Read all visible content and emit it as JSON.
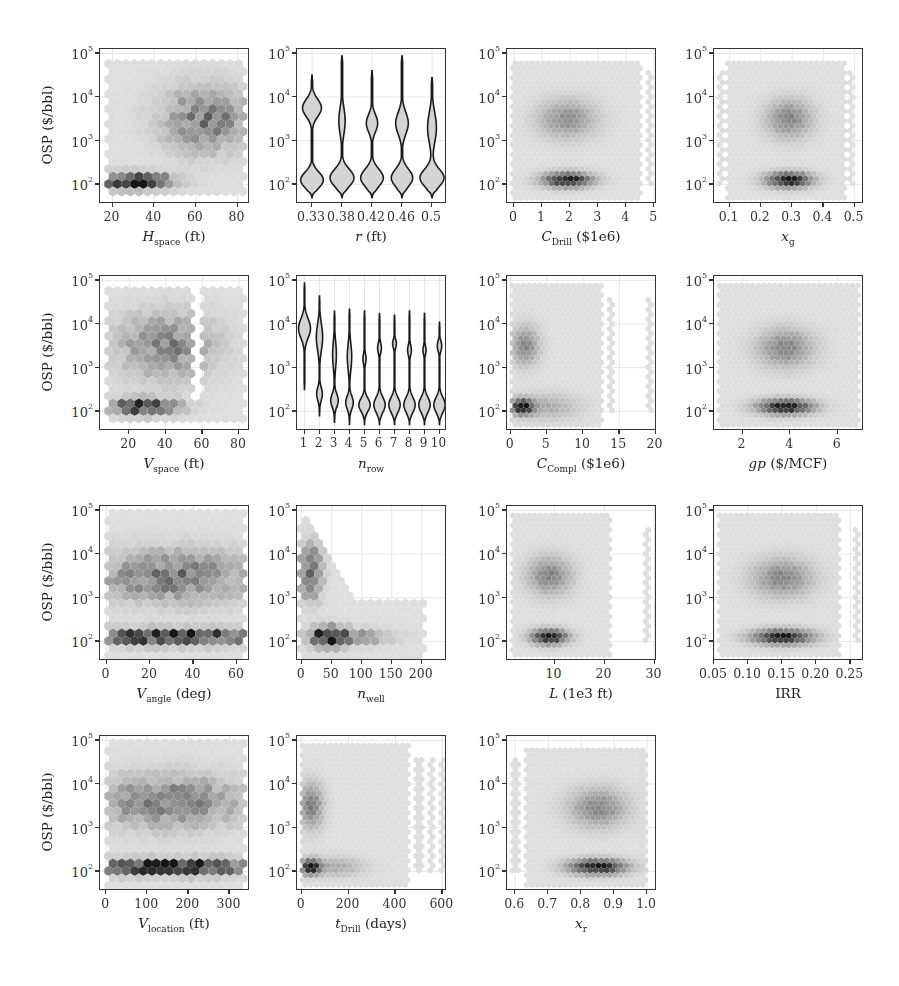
{
  "figure": {
    "ylabel": "OSP ($/bbl)",
    "yticks": [
      {
        "base": "10",
        "exp": "2",
        "value": 100
      },
      {
        "base": "10",
        "exp": "3",
        "value": 1000
      },
      {
        "base": "10",
        "exp": "4",
        "value": 10000
      },
      {
        "base": "10",
        "exp": "5",
        "value": 100000
      }
    ],
    "ylim_log10": [
      1.55,
      5.1
    ]
  },
  "chart_data": [
    {
      "type": "heatmap",
      "style": "hexbin",
      "xlabel_main": "H",
      "xlabel_sub": "space",
      "xlabel_unit": " (ft)",
      "italic": true,
      "xlim": [
        14,
        86
      ],
      "xticks": [
        20,
        40,
        60,
        80
      ],
      "ylabel": "OSP ($/bbl)",
      "yscale": "log",
      "clusters": [
        {
          "x": 30,
          "y": 2.08,
          "sx": 12,
          "sy": 0.12,
          "w": 1.0
        },
        {
          "x": 65,
          "y": 3.5,
          "sx": 14,
          "sy": 0.5,
          "w": 0.5
        }
      ],
      "span": {
        "xmin": 17,
        "xmax": 84,
        "ymin": 1.7,
        "ymax": 4.9
      },
      "coarse": true
    },
    {
      "type": "violin",
      "xlabel_main": "r",
      "xlabel_sub": "",
      "xlabel_unit": " (ft)",
      "italic": true,
      "categories": [
        "0.33",
        "0.38",
        "0.42",
        "0.46",
        "0.5"
      ],
      "yscale": "log",
      "violins": [
        {
          "lo": 1.7,
          "hi": 4.5,
          "modes": [
            {
              "y": 2.1,
              "w": 0.9,
              "s": 0.18
            },
            {
              "y": 3.75,
              "w": 0.75,
              "s": 0.2
            }
          ]
        },
        {
          "lo": 1.7,
          "hi": 4.95,
          "modes": [
            {
              "y": 2.15,
              "w": 0.95,
              "s": 0.2
            },
            {
              "y": 3.45,
              "w": 0.25,
              "s": 0.3
            }
          ]
        },
        {
          "lo": 1.7,
          "hi": 4.6,
          "modes": [
            {
              "y": 2.15,
              "w": 0.9,
              "s": 0.2
            },
            {
              "y": 3.4,
              "w": 0.45,
              "s": 0.2
            }
          ]
        },
        {
          "lo": 1.7,
          "hi": 4.95,
          "modes": [
            {
              "y": 2.15,
              "w": 0.85,
              "s": 0.2
            },
            {
              "y": 3.4,
              "w": 0.5,
              "s": 0.25
            }
          ]
        },
        {
          "lo": 1.7,
          "hi": 4.45,
          "modes": [
            {
              "y": 2.15,
              "w": 0.95,
              "s": 0.2
            },
            {
              "y": 3.3,
              "w": 0.35,
              "s": 0.35
            }
          ]
        }
      ]
    },
    {
      "type": "heatmap",
      "style": "hexbin",
      "xlabel_main": "C",
      "xlabel_sub": "Drill",
      "xlabel_unit": " ($1e6)",
      "italic": true,
      "xlim": [
        -0.25,
        5.1
      ],
      "xticks": [
        0,
        1,
        2,
        3,
        4,
        5
      ],
      "yscale": "log",
      "clusters": [
        {
          "x": 1.9,
          "y": 2.1,
          "sx": 0.6,
          "sy": 0.12,
          "w": 1.0
        },
        {
          "x": 1.9,
          "y": 3.5,
          "sx": 0.7,
          "sy": 0.3,
          "w": 0.4
        }
      ],
      "span": {
        "xmin": -0.1,
        "xmax": 4.5,
        "ymin": 1.65,
        "ymax": 4.85
      },
      "stripes": [
        4.85
      ]
    },
    {
      "type": "heatmap",
      "style": "hexbin",
      "xlabel_main": "x",
      "xlabel_sub": "g",
      "xlabel_unit": "",
      "italic": true,
      "xlim": [
        0.05,
        0.53
      ],
      "xticks": [
        "0.1",
        "0.2",
        "0.3",
        "0.4",
        "0.5"
      ],
      "xtickvals": [
        0.1,
        0.2,
        0.3,
        0.4,
        0.5
      ],
      "yscale": "log",
      "clusters": [
        {
          "x": 0.29,
          "y": 2.1,
          "sx": 0.05,
          "sy": 0.12,
          "w": 1.0
        },
        {
          "x": 0.29,
          "y": 3.5,
          "sx": 0.05,
          "sy": 0.3,
          "w": 0.45
        }
      ],
      "span": {
        "xmin": 0.09,
        "xmax": 0.47,
        "ymin": 1.65,
        "ymax": 4.85
      },
      "stripes": [
        0.075,
        0.49
      ]
    },
    {
      "type": "heatmap",
      "style": "hexbin",
      "xlabel_main": "V",
      "xlabel_sub": "space",
      "xlabel_unit": " (ft)",
      "italic": true,
      "xlim": [
        4,
        86
      ],
      "xticks": [
        20,
        40,
        60,
        80
      ],
      "yscale": "log",
      "clusters": [
        {
          "x": 28,
          "y": 2.1,
          "sx": 12,
          "sy": 0.12,
          "w": 1.0
        },
        {
          "x": 40,
          "y": 3.5,
          "sx": 18,
          "sy": 0.5,
          "w": 0.45
        }
      ],
      "span": {
        "xmin": 8,
        "xmax": 84,
        "ymin": 1.7,
        "ymax": 4.9
      },
      "coarse": true,
      "gap": [
        54,
        60
      ]
    },
    {
      "type": "violin",
      "xlabel_main": "n",
      "xlabel_sub": "row",
      "xlabel_unit": "",
      "italic": true,
      "categories": [
        "1",
        "2",
        "3",
        "4",
        "5",
        "6",
        "7",
        "8",
        "9",
        "10"
      ],
      "yscale": "log",
      "violins": [
        {
          "lo": 2.5,
          "hi": 4.95,
          "modes": [
            {
              "y": 3.9,
              "w": 0.95,
              "s": 0.22
            }
          ]
        },
        {
          "lo": 1.9,
          "hi": 4.65,
          "modes": [
            {
              "y": 2.4,
              "w": 0.45,
              "s": 0.15
            },
            {
              "y": 3.7,
              "w": 0.5,
              "s": 0.3
            }
          ]
        },
        {
          "lo": 1.75,
          "hi": 4.3,
          "modes": [
            {
              "y": 2.25,
              "w": 0.6,
              "s": 0.15
            },
            {
              "y": 3.3,
              "w": 0.3,
              "s": 0.3
            }
          ]
        },
        {
          "lo": 1.7,
          "hi": 4.35,
          "modes": [
            {
              "y": 2.2,
              "w": 0.6,
              "s": 0.15
            },
            {
              "y": 3.25,
              "w": 0.35,
              "s": 0.3
            }
          ]
        },
        {
          "lo": 1.7,
          "hi": 4.3,
          "modes": [
            {
              "y": 2.15,
              "w": 0.9,
              "s": 0.15
            },
            {
              "y": 3.2,
              "w": 0.25,
              "s": 0.12
            }
          ]
        },
        {
          "lo": 1.7,
          "hi": 4.25,
          "modes": [
            {
              "y": 2.15,
              "w": 0.9,
              "s": 0.17
            },
            {
              "y": 3.45,
              "w": 0.3,
              "s": 0.12
            }
          ]
        },
        {
          "lo": 1.7,
          "hi": 4.2,
          "modes": [
            {
              "y": 2.15,
              "w": 0.9,
              "s": 0.17
            },
            {
              "y": 3.55,
              "w": 0.3,
              "s": 0.1
            }
          ]
        },
        {
          "lo": 1.7,
          "hi": 4.3,
          "modes": [
            {
              "y": 2.15,
              "w": 0.9,
              "s": 0.17
            },
            {
              "y": 3.4,
              "w": 0.3,
              "s": 0.12
            }
          ]
        },
        {
          "lo": 1.7,
          "hi": 4.25,
          "modes": [
            {
              "y": 2.15,
              "w": 0.9,
              "s": 0.17
            },
            {
              "y": 3.4,
              "w": 0.25,
              "s": 0.1
            }
          ]
        },
        {
          "lo": 1.7,
          "hi": 4.05,
          "modes": [
            {
              "y": 2.15,
              "w": 0.9,
              "s": 0.17
            },
            {
              "y": 3.5,
              "w": 0.35,
              "s": 0.12
            }
          ]
        }
      ]
    },
    {
      "type": "heatmap",
      "style": "hexbin",
      "xlabel_main": "C",
      "xlabel_sub": "Compl",
      "xlabel_unit": " ($1e6)",
      "italic": true,
      "xlim": [
        -0.5,
        20.2
      ],
      "xticks": [
        0,
        5,
        10,
        15,
        20
      ],
      "yscale": "log",
      "clusters": [
        {
          "x": 1.6,
          "y": 2.1,
          "sx": 1.0,
          "sy": 0.12,
          "w": 1.0
        },
        {
          "x": 2,
          "y": 3.5,
          "sx": 1.3,
          "sy": 0.3,
          "w": 0.45
        },
        {
          "x": 5,
          "y": 2.1,
          "sx": 3,
          "sy": 0.2,
          "w": 0.25
        }
      ],
      "span": {
        "xmin": 0.2,
        "xmax": 12.8,
        "ymin": 1.65,
        "ymax": 4.9
      },
      "stripes": [
        13.8,
        19.2
      ]
    },
    {
      "type": "heatmap",
      "style": "hexbin",
      "xlabel_main": "gp",
      "xlabel_sub": "",
      "xlabel_unit": " ($/MCF)",
      "italic": true,
      "xlim": [
        0.8,
        7.1
      ],
      "xticks": [
        2,
        4,
        6
      ],
      "yscale": "log",
      "clusters": [
        {
          "x": 3.8,
          "y": 2.1,
          "sx": 0.8,
          "sy": 0.12,
          "w": 1.0
        },
        {
          "x": 3.8,
          "y": 3.45,
          "sx": 0.8,
          "sy": 0.3,
          "w": 0.45
        }
      ],
      "span": {
        "xmin": 1.0,
        "xmax": 6.9,
        "ymin": 1.65,
        "ymax": 4.9
      }
    },
    {
      "type": "heatmap",
      "style": "hexbin",
      "xlabel_main": "V",
      "xlabel_sub": "angle",
      "xlabel_unit": " (deg)",
      "italic": true,
      "xlim": [
        -3,
        66
      ],
      "xticks": [
        0,
        20,
        40,
        60
      ],
      "yscale": "log",
      "clusters": [
        {
          "x": 30,
          "y": 2.1,
          "sx": 30,
          "sy": 0.12,
          "w": 1.0
        },
        {
          "x": 30,
          "y": 3.5,
          "sx": 25,
          "sy": 0.4,
          "w": 0.5
        }
      ],
      "span": {
        "xmin": 0,
        "xmax": 64,
        "ymin": 1.65,
        "ymax": 4.95
      },
      "coarse": true
    },
    {
      "type": "heatmap",
      "style": "hexbin",
      "xlabel_main": "n",
      "xlabel_sub": "well",
      "xlabel_unit": "",
      "italic": true,
      "xlim": [
        -8,
        242
      ],
      "xticks": [
        0,
        50,
        100,
        150,
        200
      ],
      "yscale": "log",
      "clusters": [
        {
          "x": 45,
          "y": 2.1,
          "sx": 20,
          "sy": 0.15,
          "w": 1.0
        },
        {
          "x": 15,
          "y": 3.6,
          "sx": 12,
          "sy": 0.4,
          "w": 0.7
        },
        {
          "x": 90,
          "y": 2.1,
          "sx": 40,
          "sy": 0.12,
          "w": 0.4
        }
      ],
      "span": "decay",
      "coarse": true
    },
    {
      "type": "heatmap",
      "style": "hexbin",
      "xlabel_main": "L",
      "xlabel_sub": "",
      "xlabel_unit": " (1e3 ft)",
      "italic": true,
      "xlim": [
        0.5,
        30.5
      ],
      "xticks": [
        10,
        20,
        30
      ],
      "yscale": "log",
      "clusters": [
        {
          "x": 9,
          "y": 2.1,
          "sx": 2.5,
          "sy": 0.12,
          "w": 1.0
        },
        {
          "x": 9,
          "y": 3.5,
          "sx": 3,
          "sy": 0.3,
          "w": 0.45
        }
      ],
      "span": {
        "xmin": 1.5,
        "xmax": 21.5,
        "ymin": 1.65,
        "ymax": 4.9
      },
      "stripes": [
        28.5
      ]
    },
    {
      "type": "heatmap",
      "style": "hexbin",
      "xlabel_main": "IRR",
      "xlabel_sub": "",
      "xlabel_unit": "",
      "italic": false,
      "xlim": [
        0.05,
        0.27
      ],
      "xticks": [
        "0.05",
        "0.10",
        "0.15",
        "0.20",
        "0.25"
      ],
      "xtickvals": [
        0.05,
        0.1,
        0.15,
        0.2,
        0.25
      ],
      "yscale": "log",
      "clusters": [
        {
          "x": 0.15,
          "y": 2.1,
          "sx": 0.03,
          "sy": 0.12,
          "w": 1.0
        },
        {
          "x": 0.15,
          "y": 3.45,
          "sx": 0.03,
          "sy": 0.3,
          "w": 0.45
        }
      ],
      "span": {
        "xmin": 0.055,
        "xmax": 0.235,
        "ymin": 1.65,
        "ymax": 4.9
      },
      "stripes": [
        0.258
      ]
    },
    {
      "type": "heatmap",
      "style": "hexbin",
      "xlabel_main": "V",
      "xlabel_sub": "location",
      "xlabel_unit": " (ft)",
      "italic": true,
      "xlim": [
        -15,
        350
      ],
      "xticks": [
        0,
        100,
        200,
        300
      ],
      "yscale": "log",
      "clusters": [
        {
          "x": 160,
          "y": 2.1,
          "sx": 150,
          "sy": 0.12,
          "w": 1.0
        },
        {
          "x": 150,
          "y": 3.6,
          "sx": 120,
          "sy": 0.4,
          "w": 0.5
        }
      ],
      "span": {
        "xmin": 0,
        "xmax": 340,
        "ymin": 1.65,
        "ymax": 4.95
      },
      "coarse": true
    },
    {
      "type": "heatmap",
      "style": "hexbin",
      "xlabel_main": "t",
      "xlabel_sub": "Drill",
      "xlabel_unit": " (days)",
      "italic": true,
      "xlim": [
        -20,
        620
      ],
      "xticks": [
        0,
        200,
        400,
        600
      ],
      "yscale": "log",
      "clusters": [
        {
          "x": 40,
          "y": 2.1,
          "sx": 30,
          "sy": 0.12,
          "w": 1.0
        },
        {
          "x": 40,
          "y": 3.5,
          "sx": 35,
          "sy": 0.35,
          "w": 0.5
        },
        {
          "x": 150,
          "y": 2.1,
          "sx": 80,
          "sy": 0.15,
          "w": 0.25
        }
      ],
      "span": {
        "xmin": 0,
        "xmax": 460,
        "ymin": 1.65,
        "ymax": 4.9
      },
      "stripes": [
        500,
        550,
        600
      ]
    },
    {
      "type": "heatmap",
      "style": "hexbin",
      "xlabel_main": "x",
      "xlabel_sub": "r",
      "xlabel_unit": "",
      "italic": true,
      "xlim": [
        0.575,
        1.03
      ],
      "xticks": [
        "0.6",
        "0.7",
        "0.8",
        "0.9",
        "1.0"
      ],
      "xtickvals": [
        0.6,
        0.7,
        0.8,
        0.9,
        1.0
      ],
      "yscale": "log",
      "clusters": [
        {
          "x": 0.85,
          "y": 2.1,
          "sx": 0.06,
          "sy": 0.12,
          "w": 1.0
        },
        {
          "x": 0.85,
          "y": 3.45,
          "sx": 0.06,
          "sy": 0.3,
          "w": 0.45
        }
      ],
      "span": {
        "xmin": 0.63,
        "xmax": 1.0,
        "ymin": 1.65,
        "ymax": 4.85
      },
      "stripes": [
        0.6
      ]
    }
  ]
}
